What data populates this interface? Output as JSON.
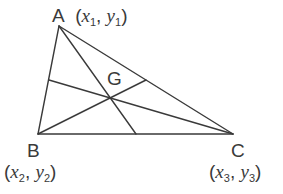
{
  "diagram": {
    "type": "triangle-with-medians",
    "stroke_color": "#3a3a3a",
    "background": "#ffffff",
    "vertices": [
      {
        "id": "A",
        "label": "A",
        "x_sym": "x",
        "y_sym": "y",
        "sub": "1",
        "px": 59,
        "py": 26
      },
      {
        "id": "B",
        "label": "B",
        "x_sym": "x",
        "y_sym": "y",
        "sub": "2",
        "px": 38,
        "py": 134
      },
      {
        "id": "C",
        "label": "C",
        "x_sym": "x",
        "y_sym": "y",
        "sub": "3",
        "px": 233,
        "py": 134
      }
    ],
    "centroid": {
      "label": "G",
      "px": 110,
      "py": 98
    },
    "medians": [
      {
        "from": "A",
        "to": "midpoint BC",
        "x1": 59,
        "y1": 26,
        "x2": 136,
        "y2": 134
      },
      {
        "from": "B",
        "to": "midpoint AC",
        "x1": 38,
        "y1": 134,
        "x2": 146,
        "y2": 80
      },
      {
        "from": "C",
        "to": "midpoint AB",
        "x1": 233,
        "y1": 134,
        "x2": 49,
        "y2": 80
      }
    ]
  }
}
